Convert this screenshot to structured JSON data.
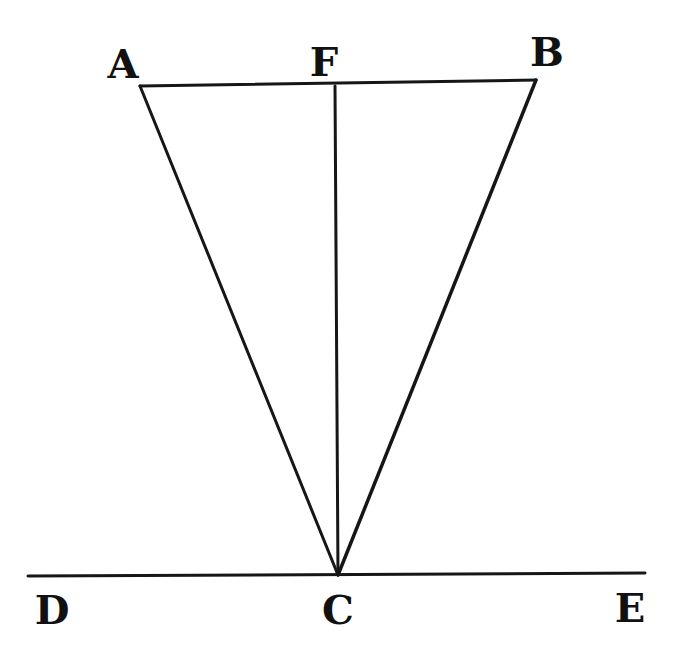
{
  "diagram": {
    "type": "geometric-figure",
    "colors": {
      "ink": "#161616",
      "background": "#ffffff"
    },
    "points": [
      {
        "id": "A",
        "label": "A",
        "x": 140,
        "y": 86,
        "label_x": 123,
        "label_y": 78
      },
      {
        "id": "F",
        "label": "F",
        "x": 335,
        "y": 86,
        "label_x": 324,
        "label_y": 76
      },
      {
        "id": "B",
        "label": "B",
        "x": 536,
        "y": 80,
        "label_x": 547,
        "label_y": 66
      },
      {
        "id": "C",
        "label": "C",
        "x": 338,
        "y": 575,
        "label_x": 338,
        "label_y": 624
      },
      {
        "id": "D",
        "label": "D",
        "x": 28,
        "y": 576,
        "label_x": 52,
        "label_y": 624
      },
      {
        "id": "E",
        "label": "E",
        "x": 645,
        "y": 573,
        "label_x": 630,
        "label_y": 622
      }
    ],
    "segments": [
      {
        "from": "A",
        "to": "B",
        "name": "segment-ab",
        "width": 3
      },
      {
        "from": "A",
        "to": "C",
        "name": "segment-ac",
        "width": 3
      },
      {
        "from": "B",
        "to": "C",
        "name": "segment-bc",
        "width": 3.5
      },
      {
        "from": "F",
        "to": "C",
        "name": "segment-fc",
        "width": 3
      },
      {
        "from": "D",
        "to": "E",
        "name": "segment-de",
        "width": 3
      }
    ]
  }
}
